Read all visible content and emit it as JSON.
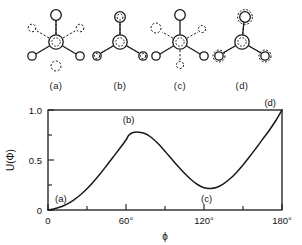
{
  "figure": {
    "conformers": [
      {
        "id": "a",
        "label": "(a)",
        "type": "eclipsed",
        "front_angle_deg": 0,
        "back_angle_deg": 0
      },
      {
        "id": "b",
        "label": "(b)",
        "type": "eclipsed-staggered-60",
        "front_angle_deg": 0,
        "back_angle_deg": 60
      },
      {
        "id": "c",
        "label": "(c)",
        "type": "eclipsed",
        "front_angle_deg": 0,
        "back_angle_deg": 120
      },
      {
        "id": "d",
        "label": "(d)",
        "type": "staggered",
        "front_angle_deg": 0,
        "back_angle_deg": 180
      }
    ]
  },
  "chart_data": {
    "type": "line",
    "title": "",
    "xlabel": "ϕ",
    "ylabel": "U(Φ)",
    "xlim": [
      0,
      180
    ],
    "ylim": [
      0,
      1.0
    ],
    "grid": false,
    "legend": null,
    "xticks": [
      0,
      30,
      60,
      90,
      120,
      150,
      180
    ],
    "xticklabels": [
      "0",
      "",
      "60°",
      "",
      "120°",
      "",
      "180°"
    ],
    "yticks": [
      0,
      0.25,
      0.5,
      0.75,
      1.0
    ],
    "yticklabels": [
      "0",
      "",
      "0.5",
      "",
      "1.0"
    ],
    "series": [
      {
        "name": "U(ϕ)",
        "x": [
          0,
          5,
          10,
          15,
          20,
          25,
          30,
          35,
          40,
          45,
          50,
          55,
          60,
          62,
          65,
          70,
          75,
          80,
          85,
          90,
          95,
          100,
          105,
          110,
          115,
          120,
          125,
          130,
          135,
          140,
          145,
          150,
          155,
          160,
          165,
          170,
          175,
          180
        ],
        "values": [
          0.0,
          0.012,
          0.032,
          0.062,
          0.102,
          0.152,
          0.212,
          0.283,
          0.36,
          0.443,
          0.528,
          0.612,
          0.7,
          0.745,
          0.773,
          0.778,
          0.762,
          0.72,
          0.66,
          0.588,
          0.512,
          0.437,
          0.367,
          0.305,
          0.255,
          0.222,
          0.215,
          0.228,
          0.262,
          0.312,
          0.376,
          0.45,
          0.532,
          0.618,
          0.706,
          0.793,
          0.89,
          1.0
        ]
      }
    ],
    "annotations": [
      {
        "text": "(a)",
        "x": 0,
        "y": 0.0,
        "position": "upper-right"
      },
      {
        "text": "(b)",
        "x": 62,
        "y": 0.78,
        "position": "above"
      },
      {
        "text": "(c)",
        "x": 122,
        "y": 0.22,
        "position": "below"
      },
      {
        "text": "(d)",
        "x": 180,
        "y": 1.0,
        "position": "left-below"
      }
    ]
  }
}
